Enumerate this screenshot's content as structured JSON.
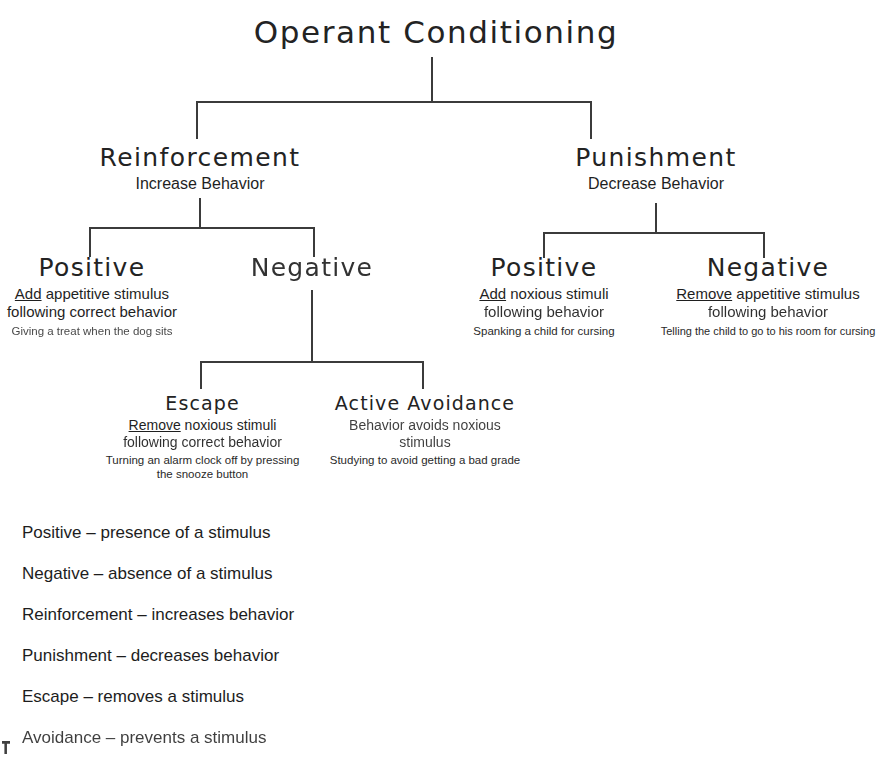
{
  "title": "Operant Conditioning",
  "tree": {
    "root": {
      "label": "Operant Conditioning"
    },
    "reinforcement": {
      "label": "Reinforcement",
      "subtitle": "Increase Behavior"
    },
    "punishment": {
      "label": "Punishment",
      "subtitle": "Decrease Behavior"
    },
    "reinforcement_positive": {
      "label": "Positive",
      "desc_underlined": "Add",
      "desc_line1_rest": " appetitive stimulus",
      "desc_line2": "following correct behavior",
      "example": "Giving a treat when the dog sits"
    },
    "reinforcement_negative": {
      "label": "Negative"
    },
    "punishment_positive": {
      "label": "Positive",
      "desc_underlined": "Add",
      "desc_line1_rest": " noxious stimuli",
      "desc_line2": "following behavior",
      "example": "Spanking a child for cursing"
    },
    "punishment_negative": {
      "label": "Negative",
      "desc_underlined": "Remove",
      "desc_line1_rest": " appetitive stimulus",
      "desc_line2": "following behavior",
      "example": "Telling the child to go to his room for cursing"
    },
    "escape": {
      "label": "Escape",
      "desc_underlined": "Remove",
      "desc_line1_rest": " noxious stimuli",
      "desc_line2": "following correct behavior",
      "example_line1": "Turning an alarm clock off by pressing",
      "example_line2": "the snooze button"
    },
    "active_avoidance": {
      "label": "Active Avoidance",
      "desc_line1": "Behavior avoids noxious",
      "desc_line2": "stimulus",
      "example": "Studying to avoid getting a bad grade"
    }
  },
  "legend": [
    "Positive – presence of a stimulus",
    "Negative – absence of a stimulus",
    "Reinforcement – increases behavior",
    "Punishment – decreases behavior",
    "Escape – removes a stimulus",
    "Avoidance – prevents a stimulus"
  ],
  "colors": {
    "ink": "#1d1d1d",
    "line": "#3b3b3b",
    "background": "#ffffff"
  }
}
